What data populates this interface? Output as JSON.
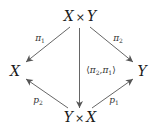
{
  "diagram": {
    "type": "commutative-diagram",
    "nodes": {
      "top": {
        "left": "X",
        "op": "×",
        "right": "Y"
      },
      "left": {
        "label": "X"
      },
      "right": {
        "label": "Y"
      },
      "bottom": {
        "left": "Y",
        "op": "×",
        "right": "X"
      }
    },
    "arrows": {
      "pi1": {
        "from": "X × Y",
        "to": "X",
        "base": "π",
        "sub": "1"
      },
      "pi2": {
        "from": "X × Y",
        "to": "Y",
        "base": "π",
        "sub": "2"
      },
      "pair": {
        "from": "X × Y",
        "to": "Y × X",
        "open": "⟨",
        "a": "π",
        "a_sub": "2",
        "comma": ",",
        "b": "π",
        "b_sub": "1",
        "close": "⟩"
      },
      "p2": {
        "from": "Y × X",
        "to": "X",
        "base": "p",
        "sub": "2"
      },
      "p1": {
        "from": "Y × X",
        "to": "Y",
        "base": "p",
        "sub": "1"
      }
    },
    "colors": {
      "line": "#555555",
      "text": "#1a1a1a"
    }
  }
}
